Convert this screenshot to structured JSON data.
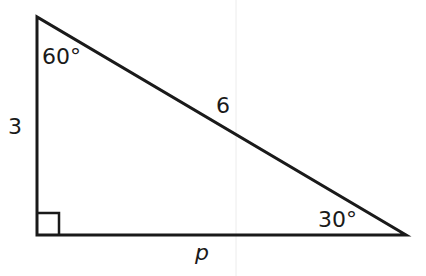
{
  "diagram": {
    "type": "right-triangle",
    "labels": {
      "top_angle": "60°",
      "right_angle": "30°",
      "left_side": "3",
      "hypotenuse": "6",
      "bottom_side": "p"
    },
    "colors": {
      "stroke": "#1a1a1a",
      "background": "#ffffff",
      "faint_line": "#e6e6e6"
    }
  }
}
